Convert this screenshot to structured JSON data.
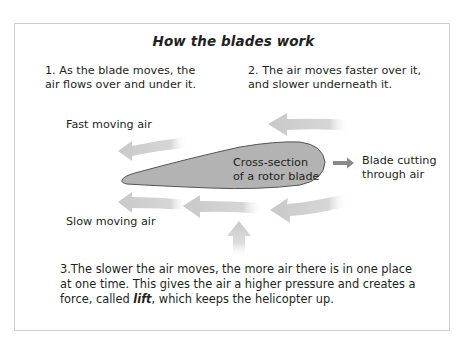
{
  "title": "How the blades work",
  "steps": {
    "step1_line1": "1. As the blade moves, the",
    "step1_line2": "air flows over and under it.",
    "step2_line1": "2. The air moves faster over it,",
    "step2_line2": "and slower underneath it.",
    "step3_line1": "3.The slower the air moves, the more air there is in one place",
    "step3_line2": "at one time. This gives the air a higher pressure and creates a",
    "step3_line3_pre": "force, called ",
    "step3_line3_em": "lift",
    "step3_line3_post": ", which keeps the helicopter up."
  },
  "labels": {
    "fast_air": "Fast moving air",
    "slow_air": "Slow moving air",
    "airfoil_line1": "Cross-section",
    "airfoil_line2": "of a rotor blade",
    "cut_line1": "Blade cutting",
    "cut_line2": "through air"
  },
  "colors": {
    "airfoil_fill": "#b3b3b3",
    "airfoil_stroke": "#555555",
    "air_arrow": "#d2d2d2",
    "direction_arrow": "#8a8a8a",
    "border": "#cfcfcf"
  }
}
